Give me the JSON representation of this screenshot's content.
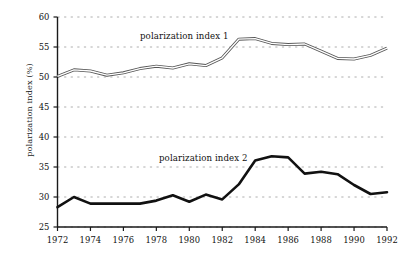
{
  "chart_data": {
    "type": "line",
    "title": "",
    "xlabel": "",
    "ylabel": "polarization index (%)",
    "xlim": [
      1972,
      1992
    ],
    "ylim": [
      25,
      60
    ],
    "grid": true,
    "grid_style": "dotted-horizontal",
    "legend_position": "inline-annotations",
    "yticks": [
      25,
      30,
      35,
      40,
      45,
      50,
      55,
      60
    ],
    "ytick_labels": [
      "25",
      "30",
      "35",
      "40",
      "45",
      "50",
      "55",
      "60"
    ],
    "xticks": [
      1972,
      1974,
      1976,
      1978,
      1980,
      1982,
      1984,
      1986,
      1988,
      1990,
      1992
    ],
    "xtick_labels": [
      "1972",
      "1974",
      "1976",
      "1978",
      "1980",
      "1982",
      "1984",
      "1986",
      "1988",
      "1990",
      "1992"
    ],
    "x": [
      1972,
      1973,
      1974,
      1975,
      1976,
      1977,
      1978,
      1979,
      1980,
      1981,
      1982,
      1983,
      1984,
      1985,
      1986,
      1987,
      1988,
      1989,
      1990,
      1991,
      1992
    ],
    "series": [
      {
        "name": "polarization index 1",
        "style": "thin-outline",
        "color": "#555555",
        "values": [
          50.1,
          51.2,
          51.0,
          50.3,
          50.7,
          51.4,
          51.8,
          51.5,
          52.2,
          51.9,
          53.2,
          56.3,
          56.4,
          55.6,
          55.4,
          55.5,
          54.3,
          53.1,
          53.0,
          53.6,
          54.8
        ]
      },
      {
        "name": "polarization index 2",
        "style": "thick-solid",
        "color": "#111111",
        "values": [
          28.3,
          30.0,
          28.9,
          28.9,
          28.9,
          28.9,
          29.4,
          30.3,
          29.2,
          30.4,
          29.6,
          32.1,
          36.1,
          36.8,
          36.6,
          33.9,
          34.2,
          33.8,
          32.0,
          30.5,
          30.8
        ]
      }
    ],
    "annotations": [
      {
        "text": "polarization index 1",
        "x_px": 140,
        "y_px": 31
      },
      {
        "text": "polarization index 2",
        "x_px": 159,
        "y_px": 153
      }
    ]
  },
  "axes": {
    "y_axis_title": "polarization index (%)"
  }
}
